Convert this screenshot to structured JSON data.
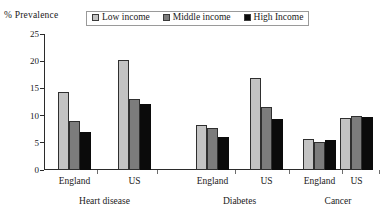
{
  "axis_title": "% Prevalence",
  "legend": {
    "entries": [
      {
        "label": "Low income",
        "color": "#c3c3c3"
      },
      {
        "label": "Middle income",
        "color": "#7c7c7c"
      },
      {
        "label": "High Income",
        "color": "#0b0b0b"
      }
    ]
  },
  "chart_data": {
    "type": "bar",
    "title": "",
    "xlabel": "",
    "ylabel": "% Prevalence",
    "ylim": [
      0,
      25
    ],
    "yticks": [
      0,
      5,
      10,
      15,
      20,
      25
    ],
    "ytick_labels": [
      "0",
      "5",
      "10",
      "15",
      "20",
      "25"
    ],
    "grid": false,
    "legend_position": "top-center",
    "groups": [
      "Heart disease",
      "Diabetes",
      "Cancer"
    ],
    "categories": [
      "Heart disease – England",
      "Heart disease – US",
      "Diabetes – England",
      "Diabetes – US",
      "Cancer – England",
      "Cancer – US"
    ],
    "country_labels": [
      "England",
      "US",
      "England",
      "US",
      "England",
      "US"
    ],
    "series": [
      {
        "name": "Low income",
        "color": "#c3c3c3",
        "values": [
          14.3,
          20.2,
          8.2,
          16.9,
          5.7,
          9.5
        ]
      },
      {
        "name": "Middle income",
        "color": "#7c7c7c",
        "values": [
          9.0,
          13.1,
          7.8,
          11.6,
          5.2,
          10.0
        ]
      },
      {
        "name": "High Income",
        "color": "#0b0b0b",
        "values": [
          7.0,
          12.1,
          6.1,
          9.4,
          5.6,
          9.8
        ]
      }
    ]
  }
}
